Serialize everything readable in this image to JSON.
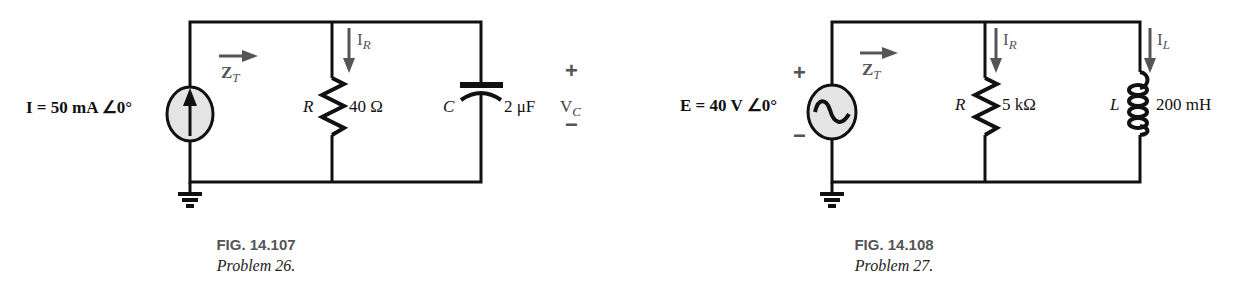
{
  "figures": [
    {
      "id": "fig-14-107",
      "caption": {
        "title": "FIG. 14.107",
        "subtitle": "Problem 26."
      },
      "source": {
        "type": "current-source",
        "label": "I = 50 mA ∠0°",
        "icon": "upward-arrow-icon"
      },
      "impedance_arrow": {
        "label": "Z",
        "subscript": "T"
      },
      "components": [
        {
          "type": "resistor",
          "symbol": "R",
          "value": "40 Ω",
          "current_label": "I",
          "current_subscript": "R"
        },
        {
          "type": "capacitor",
          "symbol": "C",
          "value": "2 μF"
        }
      ],
      "voltage": {
        "label": "V",
        "subscript": "C",
        "plus": "+",
        "minus": "−"
      }
    },
    {
      "id": "fig-14-108",
      "caption": {
        "title": "FIG. 14.108",
        "subtitle": "Problem 27."
      },
      "source": {
        "type": "ac-voltage-source",
        "label": "E = 40 V ∠0°",
        "icon": "sine-wave-icon",
        "plus": "+",
        "minus": "−"
      },
      "impedance_arrow": {
        "label": "Z",
        "subscript": "T"
      },
      "components": [
        {
          "type": "resistor",
          "symbol": "R",
          "value": "5 kΩ",
          "current_label": "I",
          "current_subscript": "R"
        },
        {
          "type": "inductor",
          "symbol": "L",
          "value": "200 mH",
          "current_label": "I",
          "current_subscript": "L"
        }
      ]
    }
  ],
  "colors": {
    "wire": "#111111",
    "annotation": "#555555",
    "source_fill": "#e4e4e4"
  }
}
